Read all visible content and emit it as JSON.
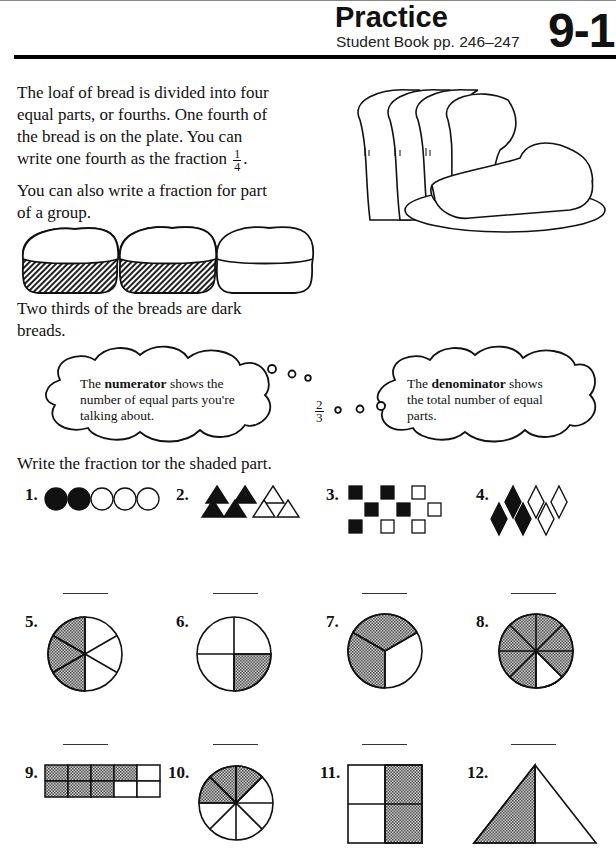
{
  "header": {
    "title": "Practice",
    "subtitle": "Student Book pp. 246–247",
    "lesson_number": "9-1"
  },
  "intro": {
    "lines": [
      "The loaf of bread is divided into four",
      "equal parts, or fourths. One fourth of",
      "the bread is on the plate. You can",
      "write one fourth as the fraction"
    ],
    "fraction": {
      "numerator": "1",
      "denominator": "4"
    },
    "group_lines": [
      "You can also write a fraction for part",
      "of a group."
    ],
    "group_breads": [
      {
        "shaded": true
      },
      {
        "shaded": true
      },
      {
        "shaded": false
      }
    ],
    "summary_lines": [
      "Two thirds of the breads are dark",
      "breads."
    ]
  },
  "clouds": {
    "numerator_cloud": {
      "prefix": "The ",
      "term": "numerator",
      "line1_rest": " shows the",
      "line2": "number of equal parts you're",
      "line3": "talking about."
    },
    "center_fraction": {
      "numerator": "2",
      "denominator": "3"
    },
    "denominator_cloud": {
      "prefix": "The ",
      "term": "denominator",
      "line1_rest": " shows",
      "line2": "the total number of equal",
      "line3": "parts."
    }
  },
  "instructions": "Write the fraction tor the shaded part.",
  "problems": [
    {
      "label": "1.",
      "shape": "circles",
      "shaded": 2,
      "total": 5
    },
    {
      "label": "2.",
      "shape": "triangles",
      "shaded": 4,
      "total": 7
    },
    {
      "label": "3.",
      "shape": "squares",
      "shaded": 5,
      "total": 9
    },
    {
      "label": "4.",
      "shape": "diamonds",
      "shaded": 3,
      "total": 6
    },
    {
      "label": "5.",
      "shape": "pie",
      "shaded": 3,
      "total": 6
    },
    {
      "label": "6.",
      "shape": "pie",
      "shaded": 1,
      "total": 4
    },
    {
      "label": "7.",
      "shape": "pie",
      "shaded": 2,
      "total": 3
    },
    {
      "label": "8.",
      "shape": "pie",
      "shaded": 7,
      "total": 8
    },
    {
      "label": "9.",
      "shape": "grid",
      "shaded": 7,
      "total": 10
    },
    {
      "label": "10.",
      "shape": "pie",
      "shaded": 3,
      "total": 8
    },
    {
      "label": "11.",
      "shape": "square-quarters",
      "shaded": 2,
      "total": 4
    },
    {
      "label": "12.",
      "shape": "triangle-halves",
      "shaded": 1,
      "total": 2
    }
  ],
  "colors": {
    "ink": "#111111",
    "shade": "#9a9a9a",
    "background": "#ffffff"
  }
}
